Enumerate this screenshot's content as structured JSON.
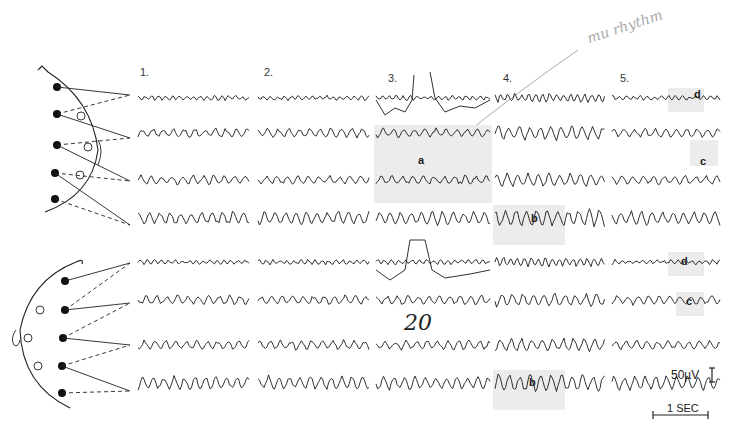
{
  "figure": {
    "columns": [
      {
        "label": "1.",
        "x": 140
      },
      {
        "label": "2.",
        "x": 264
      },
      {
        "label": "3.",
        "x": 388
      },
      {
        "label": "4.",
        "x": 503
      },
      {
        "label": "5.",
        "x": 620
      }
    ],
    "handwritten_annotation": "mu rhythm",
    "handwritten_mark": "20",
    "trace_annotations": [
      {
        "label": "a",
        "x": 418,
        "y": 154
      },
      {
        "label": "b",
        "x": 531,
        "y": 212
      },
      {
        "label": "b",
        "x": 529,
        "y": 376
      },
      {
        "label": "c",
        "x": 700,
        "y": 155
      },
      {
        "label": "c",
        "x": 686,
        "y": 295
      },
      {
        "label": "d",
        "x": 694,
        "y": 88
      },
      {
        "label": "d",
        "x": 681,
        "y": 255
      }
    ],
    "scale_bar": {
      "amplitude": "50µV",
      "time": "1 SEC"
    },
    "channel_rows_top": [
      98,
      133,
      180,
      218
    ],
    "channel_rows_bottom": [
      262,
      300,
      345,
      383
    ],
    "colors": {
      "trace": "#1a1a1a",
      "highlight": "#ececec",
      "pencil": "#aaaaaa"
    }
  }
}
